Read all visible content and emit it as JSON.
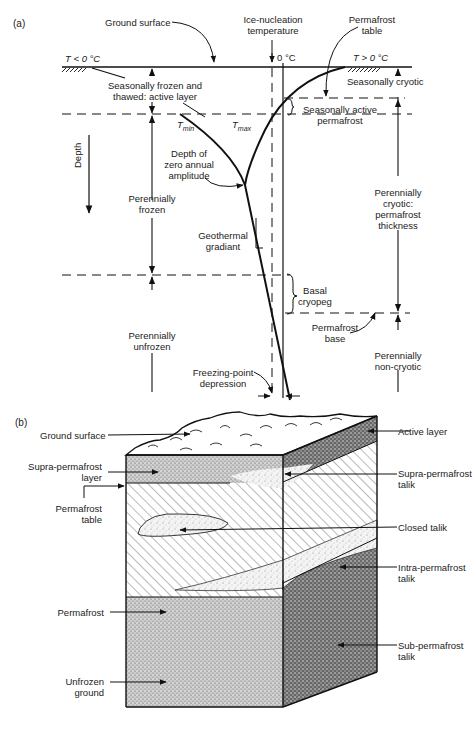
{
  "panel_a": {
    "label": "(a)",
    "labels": {
      "ground_surface": "Ground surface",
      "ice_nucleation_1": "Ice-nucleation",
      "ice_nucleation_2": "temperature",
      "zero_c": "0 °C",
      "permafrost_table_1": "Permafrost",
      "permafrost_table_2": "table",
      "t_below": "T < 0 °C",
      "t_above": "T > 0 °C",
      "active_layer_1": "Seasonally frozen and",
      "active_layer_2": "thawed: active layer",
      "seasonally_cryotic": "Seasonally cryotic",
      "seasonally_active_1": "Seasonally active",
      "seasonally_active_2": "permafrost",
      "t_min": "Tmin",
      "t_max": "Tmax",
      "depth": "Depth",
      "zero_amp_1": "Depth of",
      "zero_amp_2": "zero annual",
      "zero_amp_3": "amplitude",
      "perennially_frozen_1": "Perennially",
      "perennially_frozen_2": "frozen",
      "perennially_cryotic_1": "Perennially",
      "perennially_cryotic_2": "cryotic:",
      "perennially_cryotic_3": "permafrost",
      "perennially_cryotic_4": "thickness",
      "geothermal_1": "Geothermal",
      "geothermal_2": "gradiant",
      "basal_1": "Basal",
      "basal_2": "cryopeg",
      "pf_base_1": "Permafrost",
      "pf_base_2": "base",
      "perennially_unfrozen_1": "Perennially",
      "perennially_unfrozen_2": "unfrozen",
      "non_cryotic_1": "Perennially",
      "non_cryotic_2": "non-cryotic",
      "fp_depression_1": "Freezing-point",
      "fp_depression_2": "depression"
    }
  },
  "panel_b": {
    "label": "(b)",
    "labels": {
      "ground_surface": "Ground surface",
      "active_layer": "Active layer",
      "supra_layer_1": "Supra-permafrost",
      "supra_layer_2": "layer",
      "supra_talik_1": "Supra-permafrost",
      "supra_talik_2": "talik",
      "pf_table_1": "Permafrost",
      "pf_table_2": "table",
      "closed_talik": "Closed talik",
      "intra_talik_1": "Intra-permafrost",
      "intra_talik_2": "talik",
      "permafrost": "Permafrost",
      "sub_talik_1": "Sub-permafrost",
      "sub_talik_2": "talik",
      "unfrozen_1": "Unfrozen",
      "unfrozen_2": "ground"
    }
  }
}
